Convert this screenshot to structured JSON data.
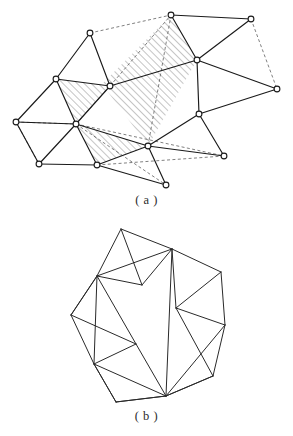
{
  "figure": {
    "caption_a": "( a )",
    "caption_b": "( b )",
    "colors": {
      "solid_edge": "#1a1a1a",
      "dashed_edge": "#555555",
      "hatch_line": "#6e6e6e",
      "node_fill": "#ffffff",
      "background": "#ffffff",
      "caption_text": "#2b2b2b"
    }
  },
  "panel_a": {
    "name": "triangulated-mesh-with-hatched-regions",
    "nodes": [
      {
        "id": "n0",
        "x": 90,
        "y": 33
      },
      {
        "id": "n1",
        "x": 56,
        "y": 79
      },
      {
        "id": "n2",
        "x": 110,
        "y": 86
      },
      {
        "id": "n3",
        "x": 16,
        "y": 122
      },
      {
        "id": "n4",
        "x": 76,
        "y": 124
      },
      {
        "id": "n5",
        "x": 39,
        "y": 164
      },
      {
        "id": "n6",
        "x": 97,
        "y": 165
      },
      {
        "id": "n7",
        "x": 171,
        "y": 15
      },
      {
        "id": "n8",
        "x": 251,
        "y": 19
      },
      {
        "id": "n9",
        "x": 197,
        "y": 60
      },
      {
        "id": "n10",
        "x": 277,
        "y": 89
      },
      {
        "id": "n11",
        "x": 199,
        "y": 114
      },
      {
        "id": "n12",
        "x": 148,
        "y": 146
      },
      {
        "id": "n13",
        "x": 224,
        "y": 156
      },
      {
        "id": "n14",
        "x": 166,
        "y": 185
      }
    ],
    "solid_edges": [
      [
        "n0",
        "n1"
      ],
      [
        "n0",
        "n2"
      ],
      [
        "n1",
        "n2"
      ],
      [
        "n1",
        "n3"
      ],
      [
        "n1",
        "n4"
      ],
      [
        "n3",
        "n4"
      ],
      [
        "n3",
        "n5"
      ],
      [
        "n4",
        "n5"
      ],
      [
        "n4",
        "n6"
      ],
      [
        "n5",
        "n6"
      ],
      [
        "n2",
        "n4"
      ],
      [
        "n4",
        "n12"
      ],
      [
        "n6",
        "n12"
      ],
      [
        "n6",
        "n14"
      ],
      [
        "n7",
        "n8"
      ],
      [
        "n7",
        "n9"
      ],
      [
        "n8",
        "n9"
      ],
      [
        "n9",
        "n10"
      ],
      [
        "n9",
        "n11"
      ],
      [
        "n10",
        "n11"
      ],
      [
        "n11",
        "n12"
      ],
      [
        "n11",
        "n13"
      ],
      [
        "n12",
        "n13"
      ],
      [
        "n12",
        "n14"
      ],
      [
        "n9",
        "n2"
      ]
    ],
    "dashed_edges": [
      [
        "n0",
        "n7"
      ],
      [
        "n2",
        "n7"
      ],
      [
        "n7",
        "n12"
      ],
      [
        "n8",
        "n10"
      ],
      [
        "n3",
        "n5"
      ],
      [
        "n3",
        "n4"
      ],
      [
        "n4",
        "n13"
      ],
      [
        "n4",
        "n14"
      ],
      [
        "n6",
        "n13"
      ],
      [
        "n2",
        "n4"
      ]
    ],
    "hatched_regions": [
      {
        "name": "large-hatched-quad",
        "points": "171,15 197,60 148,146 102,84"
      },
      {
        "name": "upper-left-hatched-triangle",
        "points": "56,79 110,86 76,124"
      },
      {
        "name": "lower-left-hatched-triangle",
        "points": "76,124 97,165 148,146"
      }
    ]
  },
  "panel_b": {
    "name": "triangulated-polygon-outline",
    "nodes": [
      {
        "id": "m0",
        "x": 121,
        "y": 229
      },
      {
        "id": "m1",
        "x": 172,
        "y": 249
      },
      {
        "id": "m2",
        "x": 221,
        "y": 272
      },
      {
        "id": "m3",
        "x": 225,
        "y": 325
      },
      {
        "id": "m4",
        "x": 213,
        "y": 376
      },
      {
        "id": "m5",
        "x": 166,
        "y": 396
      },
      {
        "id": "m6",
        "x": 116,
        "y": 402
      },
      {
        "id": "m7",
        "x": 94,
        "y": 364
      },
      {
        "id": "m8",
        "x": 71,
        "y": 315
      },
      {
        "id": "m9",
        "x": 97,
        "y": 276
      },
      {
        "id": "m10",
        "x": 142,
        "y": 285
      },
      {
        "id": "m11",
        "x": 176,
        "y": 308
      },
      {
        "id": "m12",
        "x": 136,
        "y": 344
      }
    ],
    "edges": [
      [
        "m0",
        "m1"
      ],
      [
        "m1",
        "m2"
      ],
      [
        "m2",
        "m3"
      ],
      [
        "m3",
        "m4"
      ],
      [
        "m4",
        "m5"
      ],
      [
        "m5",
        "m6"
      ],
      [
        "m6",
        "m7"
      ],
      [
        "m7",
        "m8"
      ],
      [
        "m8",
        "m9"
      ],
      [
        "m9",
        "m0"
      ],
      [
        "m0",
        "m10"
      ],
      [
        "m9",
        "m10"
      ],
      [
        "m1",
        "m10"
      ],
      [
        "m1",
        "m9"
      ],
      [
        "m1",
        "m11"
      ],
      [
        "m1",
        "m5"
      ],
      [
        "m2",
        "m11"
      ],
      [
        "m3",
        "m11"
      ],
      [
        "m3",
        "m5"
      ],
      [
        "m4",
        "m11"
      ],
      [
        "m4",
        "m5"
      ],
      [
        "m9",
        "m8"
      ],
      [
        "m9",
        "m12"
      ],
      [
        "m9",
        "m7"
      ],
      [
        "m8",
        "m12"
      ],
      [
        "m12",
        "m7"
      ],
      [
        "m12",
        "m5"
      ],
      [
        "m7",
        "m5"
      ],
      [
        "m7",
        "m6"
      ],
      [
        "m6",
        "m5"
      ]
    ]
  }
}
